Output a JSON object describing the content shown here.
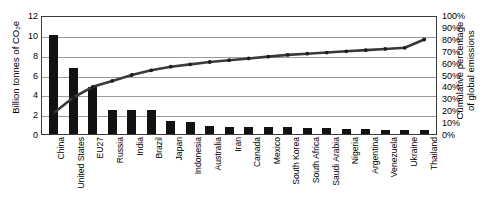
{
  "chart_data": {
    "type": "bar",
    "title": "",
    "subtitle": "",
    "xlabel": "",
    "ylabel": "Billion tonnes of CO2e",
    "ylabel_display": "Billion tonnes of CO₂e",
    "y2label": "Cumulative percentage of global emissions",
    "y2label_line1": "Cumulative percentage",
    "y2label_line2": "of global emissions",
    "categories": [
      "China",
      "United States",
      "EU27",
      "Russia",
      "India",
      "Brazil",
      "Japan",
      "Indonesia",
      "Australia",
      "Iran",
      "Canada",
      "Mexico",
      "South Korea",
      "South Africa",
      "Saudi Arabia",
      "Nigeria",
      "Argentina",
      "Venezuela",
      "Ukraine",
      "Thailand"
    ],
    "series": [
      {
        "name": "Annual emissions",
        "type": "bar",
        "axis": "left",
        "unit": "Billion tonnes of CO2e",
        "color": "#121212",
        "values": [
          10.0,
          6.7,
          4.7,
          2.45,
          2.4,
          2.4,
          1.3,
          1.2,
          0.8,
          0.75,
          0.72,
          0.7,
          0.68,
          0.6,
          0.58,
          0.5,
          0.47,
          0.45,
          0.42,
          0.4
        ]
      },
      {
        "name": "Cumulative percentage of global emissions",
        "type": "line",
        "axis": "right",
        "unit": "%",
        "color": "#3a3a3a",
        "values": [
          19,
          32,
          41,
          46,
          51,
          55,
          58,
          60,
          62,
          63.5,
          65,
          66.5,
          68,
          69,
          70,
          71,
          72,
          73,
          74,
          81
        ]
      }
    ],
    "ylim": [
      0,
      12
    ],
    "y2lim": [
      0,
      100
    ],
    "yticks": [
      "0",
      "2",
      "4",
      "6",
      "8",
      "10",
      "12"
    ],
    "y2ticks": [
      "0%",
      "10%",
      "20%",
      "30%",
      "40%",
      "50%",
      "60%",
      "70%",
      "80%",
      "90%",
      "100%"
    ],
    "gridlines": {
      "horizontal": true,
      "vertical": false,
      "axis": "left",
      "at": [
        0,
        2,
        4,
        6,
        8,
        10,
        12
      ]
    },
    "legend": {
      "visible": false,
      "position": "none",
      "entries": []
    },
    "annotations": []
  }
}
